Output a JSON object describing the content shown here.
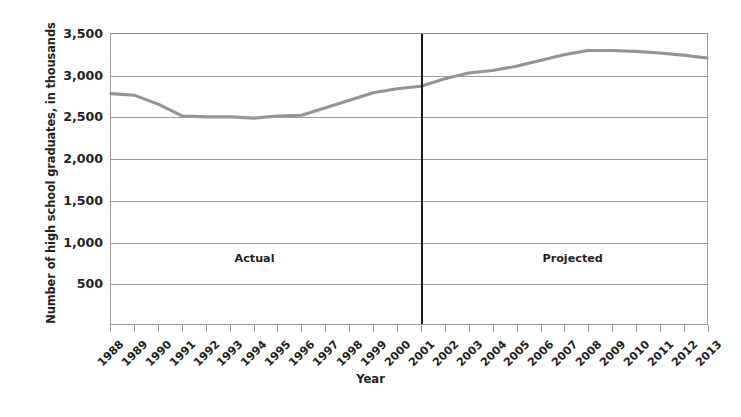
{
  "chart_data": {
    "type": "line",
    "title": "",
    "xlabel": "Year",
    "ylabel": "Number of high school graduates, in thousands",
    "x": [
      1988,
      1989,
      1990,
      1991,
      1992,
      1993,
      1994,
      1995,
      1996,
      1997,
      1998,
      1999,
      2000,
      2001,
      2002,
      2003,
      2004,
      2005,
      2006,
      2007,
      2008,
      2009,
      2010,
      2011,
      2012,
      2013
    ],
    "categories": [
      "1988",
      "1989",
      "1990",
      "1991",
      "1992",
      "1993",
      "1994",
      "1995",
      "1996",
      "1997",
      "1998",
      "1999",
      "2000",
      "2001",
      "2002",
      "2003",
      "2004",
      "2005",
      "2006",
      "2007",
      "2008",
      "2009",
      "2010",
      "2011",
      "2012",
      "2013"
    ],
    "values": [
      2780,
      2760,
      2650,
      2510,
      2500,
      2500,
      2485,
      2510,
      2520,
      2610,
      2700,
      2790,
      2840,
      2870,
      2960,
      3030,
      3060,
      3110,
      3180,
      3250,
      3300,
      3300,
      3290,
      3270,
      3245,
      3210
    ],
    "series": [
      {
        "name": "Number of high school graduates",
        "values": [
          2780,
          2760,
          2650,
          2510,
          2500,
          2500,
          2485,
          2510,
          2520,
          2610,
          2700,
          2790,
          2840,
          2870,
          2960,
          3030,
          3060,
          3110,
          3180,
          3250,
          3300,
          3300,
          3290,
          3270,
          3245,
          3210
        ]
      }
    ],
    "ylim": [
      0,
      3500
    ],
    "yticks": [
      500,
      1000,
      1500,
      2000,
      2500,
      3000,
      3500
    ],
    "ytick_labels": [
      "500",
      "1,000",
      "1,500",
      "2,000",
      "2,500",
      "3,000",
      "3,500"
    ],
    "grid": true,
    "legend": "none",
    "line_color": "#949494",
    "grid_color": "#9c9c9c",
    "text_color": "#231f20",
    "divider_color": "#1a1a1a",
    "annotations": [
      {
        "name": "actual-region-label",
        "text": "Actual",
        "x_year": 1994,
        "y_value": 810
      },
      {
        "name": "projected-region-label",
        "text": "Projected",
        "x_year": 2007.3,
        "y_value": 810
      }
    ],
    "divider": {
      "x_year": 2001,
      "label": "actual-projected-divider"
    }
  }
}
